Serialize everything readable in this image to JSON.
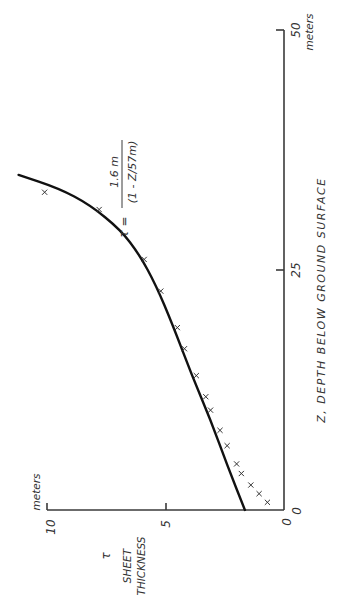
{
  "chart_data": {
    "type": "line",
    "orientation": "rotated-90-ccw",
    "title": "",
    "xlabel": "Z, DEPTH BELOW GROUND SURFACE",
    "x_unit": "meters",
    "ylabel_symbol": "τ",
    "ylabel": "SHEET THICKNESS",
    "y_unit": "meters",
    "xlim": [
      0,
      50
    ],
    "ylim": [
      0,
      10
    ],
    "x_ticks": [
      "0",
      "25",
      "50"
    ],
    "y_ticks": [
      "0",
      "5",
      "10"
    ],
    "grid": false,
    "annotation": {
      "lhs": "τ =",
      "numerator": "1.6 m",
      "denominator": "(1 - Z/57m)"
    },
    "series": [
      {
        "name": "fitted curve",
        "style": "line",
        "x": [
          0,
          4.7,
          9.4,
          14.1,
          19.3,
          23.4,
          26.6,
          29.2,
          31.8,
          33.5,
          34.9
        ],
        "y": [
          1.65,
          2.4,
          3.1,
          3.9,
          4.7,
          5.4,
          6.1,
          6.9,
          8.2,
          9.5,
          11.2
        ]
      },
      {
        "name": "measured",
        "style": "x-marker",
        "x": [
          0.8,
          1.7,
          2.6,
          3.8,
          4.8,
          6.7,
          8.3,
          10.4,
          11.8,
          14.0,
          16.8,
          19.0,
          22.8,
          26.1,
          31.3,
          33.1
        ],
        "y": [
          0.7,
          1.05,
          1.4,
          1.8,
          2.0,
          2.4,
          2.7,
          3.1,
          3.3,
          3.7,
          4.2,
          4.5,
          5.2,
          5.9,
          7.8,
          10.1
        ]
      }
    ]
  },
  "labels": {
    "z_axis_title": "Z,  DEPTH  BELOW  GROUND  SURFACE",
    "z_unit": "meters",
    "tau_unit": "meters",
    "tau_symbol": "τ",
    "tau_title_1": "SHEET",
    "tau_title_2": "THICKNESS",
    "z_tick_0": "0",
    "z_tick_25": "25",
    "z_tick_50": "50",
    "tau_tick_0": "0",
    "tau_tick_5": "5",
    "tau_tick_10": "10",
    "formula_lhs": "τ =",
    "formula_num": "1.6 m",
    "formula_den": "(1 - Z/57m)"
  },
  "colors": {
    "ink": "#111111",
    "axis": "#3a3a3a",
    "background": "#ffffff"
  }
}
